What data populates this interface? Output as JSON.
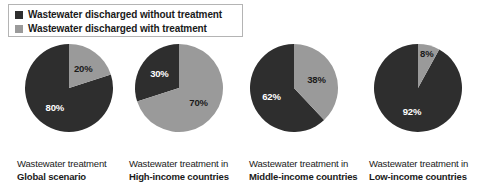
{
  "legend": {
    "items": [
      {
        "label": "Wastewater discharged without treatment",
        "color": "#2e2e2e",
        "swatch_icon": "square-swatch-icon"
      },
      {
        "label": "Wastewater discharged with treatment",
        "color": "#9a9a9a",
        "swatch_icon": "square-swatch-icon"
      }
    ]
  },
  "chart_data": {
    "type": "pie",
    "title": "",
    "legend_position": "top-left",
    "series_names": [
      "Wastewater discharged without treatment",
      "Wastewater discharged with treatment"
    ],
    "colors": {
      "without_treatment": "#2e2e2e",
      "with_treatment": "#9a9a9a"
    },
    "charts": [
      {
        "caption_line1": "Wastewater treatment",
        "caption_line2": "Global scenario",
        "categories": [
          "Wastewater discharged without treatment",
          "Wastewater discharged with treatment"
        ],
        "values": [
          80,
          20
        ],
        "labels": [
          "80%",
          "20%"
        ]
      },
      {
        "caption_line1": "Wastewater treatment in",
        "caption_line2": "High-income countries",
        "categories": [
          "Wastewater discharged without treatment",
          "Wastewater discharged with treatment"
        ],
        "values": [
          30,
          70
        ],
        "labels": [
          "30%",
          "70%"
        ]
      },
      {
        "caption_line1": "Wastewater treatment in",
        "caption_line2": "Middle-income countries",
        "categories": [
          "Wastewater discharged without treatment",
          "Wastewater discharged with treatment"
        ],
        "values": [
          62,
          38
        ],
        "labels": [
          "62%",
          "38%"
        ]
      },
      {
        "caption_line1": "Wastewater treatment in",
        "caption_line2": "Low-income countries",
        "categories": [
          "Wastewater discharged without treatment",
          "Wastewater discharged with treatment"
        ],
        "values": [
          92,
          8
        ],
        "labels": [
          "92%",
          "8%"
        ]
      }
    ]
  }
}
